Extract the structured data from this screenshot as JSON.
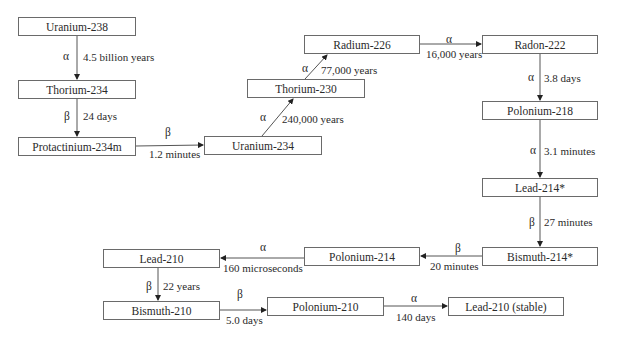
{
  "diagram": {
    "nodes": [
      {
        "id": "u238",
        "label": "Uranium-238"
      },
      {
        "id": "th234",
        "label": "Thorium-234"
      },
      {
        "id": "pa234m",
        "label": "Protactinium-234m"
      },
      {
        "id": "u234",
        "label": "Uranium-234"
      },
      {
        "id": "th230",
        "label": "Thorium-230"
      },
      {
        "id": "ra226",
        "label": "Radium-226"
      },
      {
        "id": "rn222",
        "label": "Radon-222"
      },
      {
        "id": "po218",
        "label": "Polonium-218"
      },
      {
        "id": "pb214",
        "label": "Lead-214*"
      },
      {
        "id": "bi214",
        "label": "Bismuth-214*"
      },
      {
        "id": "po214",
        "label": "Polonium-214"
      },
      {
        "id": "pb210",
        "label": "Lead-210"
      },
      {
        "id": "bi210",
        "label": "Bismuth-210"
      },
      {
        "id": "po210",
        "label": "Polonium-210"
      },
      {
        "id": "pb206",
        "label": "Lead-210 (stable)"
      }
    ],
    "edges": [
      {
        "from": "u238",
        "to": "th234",
        "decay": "α",
        "half_life": "4.5 billion years"
      },
      {
        "from": "th234",
        "to": "pa234m",
        "decay": "β",
        "half_life": "24 days"
      },
      {
        "from": "pa234m",
        "to": "u234",
        "decay": "β",
        "half_life": "1.2 minutes"
      },
      {
        "from": "u234",
        "to": "th230",
        "decay": "α",
        "half_life": "240,000 years"
      },
      {
        "from": "th230",
        "to": "ra226",
        "decay": "α",
        "half_life": "77,000 years"
      },
      {
        "from": "ra226",
        "to": "rn222",
        "decay": "α",
        "half_life": "16,000 years"
      },
      {
        "from": "rn222",
        "to": "po218",
        "decay": "α",
        "half_life": "3.8 days"
      },
      {
        "from": "po218",
        "to": "pb214",
        "decay": "α",
        "half_life": "3.1 minutes"
      },
      {
        "from": "pb214",
        "to": "bi214",
        "decay": "β",
        "half_life": "27 minutes"
      },
      {
        "from": "bi214",
        "to": "po214",
        "decay": "β",
        "half_life": "20 minutes"
      },
      {
        "from": "po214",
        "to": "pb210",
        "decay": "α",
        "half_life": "160 microseconds"
      },
      {
        "from": "pb210",
        "to": "bi210",
        "decay": "β",
        "half_life": "22 years"
      },
      {
        "from": "bi210",
        "to": "po210",
        "decay": "β",
        "half_life": "5.0 days"
      },
      {
        "from": "po210",
        "to": "pb206",
        "decay": "α",
        "half_life": "140 days"
      }
    ]
  }
}
